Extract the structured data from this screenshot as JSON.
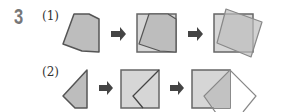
{
  "problem": {
    "number": "3",
    "parts": [
      {
        "label": "(1)"
      },
      {
        "label": "(2)"
      }
    ]
  },
  "colors": {
    "fill_dark": "#bdbdbd",
    "fill_light": "#d6d6d6",
    "stroke": "#555555",
    "stroke_light": "#999999",
    "arrow": "#444444"
  }
}
